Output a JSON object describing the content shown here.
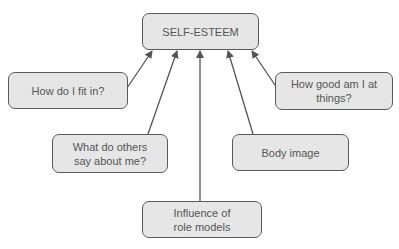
{
  "diagram": {
    "type": "concept-map",
    "colors": {
      "node_fill": "#e6e6e6",
      "node_border": "#5a5a5a",
      "text": "#555555",
      "arrow": "#555555"
    },
    "center": {
      "id": "self-esteem",
      "label": "SELF-ESTEEM"
    },
    "nodes": [
      {
        "id": "fit-in",
        "label": "How do I fit in?"
      },
      {
        "id": "good-at-things",
        "label": "How good am I at things?"
      },
      {
        "id": "others-say",
        "label": "What do others say about me?"
      },
      {
        "id": "body-image",
        "label": "Body image"
      },
      {
        "id": "role-models",
        "label": "Influence of role models"
      }
    ],
    "edges": [
      {
        "from": "fit-in",
        "to": "self-esteem"
      },
      {
        "from": "others-say",
        "to": "self-esteem"
      },
      {
        "from": "role-models",
        "to": "self-esteem"
      },
      {
        "from": "body-image",
        "to": "self-esteem"
      },
      {
        "from": "good-at-things",
        "to": "self-esteem"
      }
    ]
  }
}
